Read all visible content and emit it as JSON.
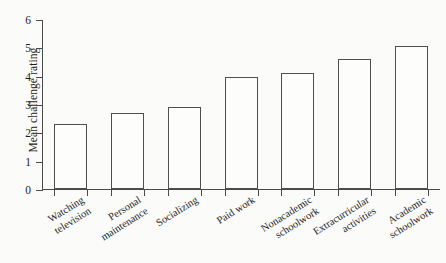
{
  "chart_data": {
    "type": "bar",
    "title": "",
    "xlabel": "",
    "ylabel": "Mean challenge rating",
    "ylim": [
      0,
      6
    ],
    "ytick_labels": [
      "0",
      "1",
      "2",
      "3",
      "4",
      "5",
      "6"
    ],
    "ytick_values": [
      0,
      1,
      2,
      3,
      4,
      5,
      6
    ],
    "grid": false,
    "legend": null,
    "bar_fill_color": "#fdfdfc",
    "bar_edge_color": "#4f4f4f",
    "axis_color": "#4a4a4a",
    "background_color": "#fbfbfa",
    "categories": [
      "Watching\ntelevision",
      "Personal\nmaintenance",
      "Socializing",
      "Paid work",
      "Nonacademic\nschoolwork",
      "Extracurricular\nactivities",
      "Academic\nschoolwork"
    ],
    "values": [
      2.3,
      2.7,
      2.9,
      3.95,
      4.1,
      4.6,
      5.05
    ],
    "series": [
      {
        "name": "Mean challenge rating",
        "values": [
          2.3,
          2.7,
          2.9,
          3.95,
          4.1,
          4.6,
          5.05
        ]
      }
    ]
  }
}
